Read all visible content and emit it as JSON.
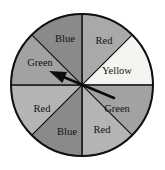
{
  "figure": {
    "name": "spinner-wheel",
    "background_color": "#ffffff",
    "outline_color": "#111111"
  },
  "wheel": {
    "center_x": 82,
    "center_y": 85,
    "radius": 71,
    "sector_count": 8,
    "sector_angle_degrees": 45
  },
  "pointer": {
    "name": "spinner-arrow",
    "tail_x": 114,
    "tail_y": 98,
    "tip_x": 49,
    "tip_y": 71,
    "color": "#0d0d0d",
    "points_to_sector_label": "Green",
    "points_to_sector_index": 5
  },
  "chart_data": {
    "type": "pie",
    "title": "",
    "xlabel": "",
    "ylabel": "",
    "legend_position": "none",
    "grid": false,
    "categories": [
      "Red",
      "Yellow",
      "Green",
      "Red",
      "Blue",
      "Red",
      "Green",
      "Blue"
    ],
    "values": [
      45,
      45,
      45,
      45,
      45,
      45,
      45,
      45
    ],
    "sectors": [
      {
        "index": 0,
        "label": "Red",
        "start_angle": 0,
        "end_angle": 45,
        "fill": "#a9a9a9",
        "label_x": 104,
        "label_y": 42
      },
      {
        "index": 1,
        "label": "Yellow",
        "start_angle": 45,
        "end_angle": 90,
        "fill": "#f4f4f1",
        "label_x": 117,
        "label_y": 72
      },
      {
        "index": 2,
        "label": "Green",
        "start_angle": 90,
        "end_angle": 135,
        "fill": "#a2a2a2",
        "label_x": 117,
        "label_y": 110
      },
      {
        "index": 3,
        "label": "Red",
        "start_angle": 135,
        "end_angle": 180,
        "fill": "#b4b4b4",
        "label_x": 102,
        "label_y": 131
      },
      {
        "index": 4,
        "label": "Blue",
        "start_angle": 180,
        "end_angle": 225,
        "fill": "#8a8a8a",
        "label_x": 67,
        "label_y": 133
      },
      {
        "index": 5,
        "label": "Red",
        "start_angle": 225,
        "end_angle": 270,
        "fill": "#b4b4b4",
        "label_x": 42,
        "label_y": 110
      },
      {
        "index": 6,
        "label": "Green",
        "start_angle": 270,
        "end_angle": 315,
        "fill": "#a2a2a2",
        "label_x": 40,
        "label_y": 64
      },
      {
        "index": 7,
        "label": "Blue",
        "start_angle": 315,
        "end_angle": 360,
        "fill": "#8a8a8a",
        "label_x": 65,
        "label_y": 40
      }
    ]
  }
}
